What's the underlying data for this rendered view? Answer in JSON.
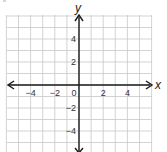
{
  "chart_data": {
    "type": "line",
    "title": "",
    "xlabel": "x",
    "ylabel": "y",
    "xlim": [
      -6,
      6
    ],
    "ylim": [
      -6,
      6
    ],
    "grid": true,
    "grid_step": 1,
    "x_ticks": [
      {
        "value": -4,
        "label": "−4"
      },
      {
        "value": -2,
        "label": "−2"
      },
      {
        "value": 0,
        "label": "0"
      },
      {
        "value": 2,
        "label": "2"
      },
      {
        "value": 4,
        "label": "4"
      }
    ],
    "y_ticks": [
      {
        "value": 4,
        "label": "4"
      },
      {
        "value": 2,
        "label": "2"
      },
      {
        "value": -2,
        "label": "−2"
      },
      {
        "value": -4,
        "label": "−4"
      }
    ],
    "series": [],
    "colors": {
      "grid": "#c8c8c8",
      "axis": "#1a1a1a",
      "text": "#333333"
    }
  }
}
